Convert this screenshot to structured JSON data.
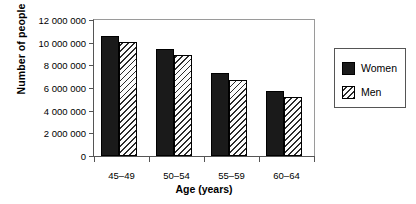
{
  "chart_data": {
    "type": "bar",
    "title": "",
    "xlabel": "Age (years)",
    "ylabel": "Number of people",
    "categories": [
      "45–49",
      "50–54",
      "55–59",
      "60–64"
    ],
    "series": [
      {
        "name": "Women",
        "values": [
          10600000,
          9400000,
          7300000,
          5750000
        ],
        "fill": "solid-dark",
        "color": "#1a1a1a"
      },
      {
        "name": "Men",
        "values": [
          10050000,
          8900000,
          6750000,
          5200000
        ],
        "fill": "diagonal-hatch",
        "color": "#ffffff"
      }
    ],
    "ylim": [
      0,
      12000000
    ],
    "ytick_values": [
      0,
      2000000,
      4000000,
      6000000,
      8000000,
      10000000,
      12000000
    ],
    "ytick_labels": [
      "0",
      "2 000 000",
      "4 000 000",
      "6 000 000",
      "8 000 000",
      "10 000 000",
      "12 000 000"
    ],
    "grid": false,
    "legend_position": "right-outside",
    "legend_entries": [
      "Women",
      "Men"
    ]
  }
}
